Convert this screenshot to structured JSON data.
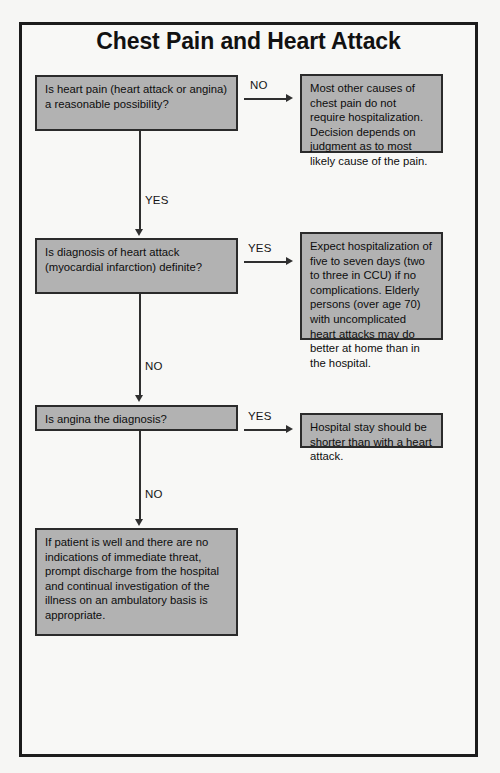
{
  "page": {
    "title": "Chest Pain and Heart Attack",
    "footer_left": "",
    "footer_right": ""
  },
  "colors": {
    "node_fill": "#b2b2b2",
    "node_border": "#2b2b2b",
    "frame_border": "#1c1c1c",
    "page_background": "#f6f6f4",
    "text": "#0d0d0d"
  },
  "flow": {
    "nodes": [
      {
        "id": "q1",
        "kind": "decision",
        "text": "Is heart pain (heart attack or angina) a reasonable possibility?"
      },
      {
        "id": "a1",
        "kind": "outcome",
        "text": "Most other causes of chest pain do not require hospitalization. Decision depends on judgment as to most likely cause of the pain."
      },
      {
        "id": "q2",
        "kind": "decision",
        "text": "Is diagnosis of heart attack (myocardial infarction) definite?"
      },
      {
        "id": "a2",
        "kind": "outcome",
        "text": "Expect hospitalization of five to seven days (two to three in CCU) if no complications. Elderly persons (over age 70) with uncomplicated heart attacks may do better at home than in the hospital."
      },
      {
        "id": "q3",
        "kind": "decision",
        "text": "Is angina the diagnosis?"
      },
      {
        "id": "a3",
        "kind": "outcome",
        "text": "Hospital stay should be shorter than with a heart attack."
      },
      {
        "id": "a4",
        "kind": "outcome",
        "text": "If patient is well and there are no indications of immediate threat, prompt discharge from the hospital and continual investigation of the illness on an ambulatory basis is appropriate."
      }
    ],
    "edges": [
      {
        "id": "e1",
        "from": "q1",
        "to": "a1",
        "label": "NO",
        "direction": "right"
      },
      {
        "id": "e2",
        "from": "q1",
        "to": "q2",
        "label": "YES",
        "direction": "down"
      },
      {
        "id": "e3",
        "from": "q2",
        "to": "a2",
        "label": "YES",
        "direction": "right"
      },
      {
        "id": "e4",
        "from": "q2",
        "to": "q3",
        "label": "NO",
        "direction": "down"
      },
      {
        "id": "e5",
        "from": "q3",
        "to": "a3",
        "label": "YES",
        "direction": "right"
      },
      {
        "id": "e6",
        "from": "q3",
        "to": "a4",
        "label": "NO",
        "direction": "down"
      }
    ]
  }
}
